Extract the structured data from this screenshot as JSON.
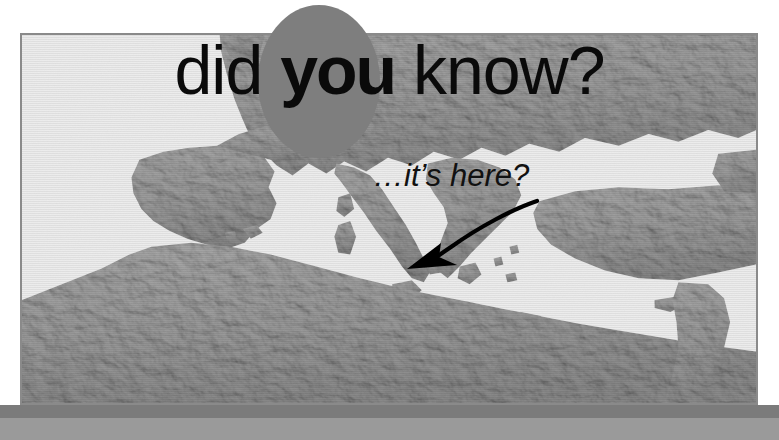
{
  "poster": {
    "headline": {
      "part1": "did ",
      "emphasis": "you",
      "part2": " know?"
    },
    "caption": "…it’s here?",
    "ellipse_color": "#7e7e7e",
    "headline_color": "#0a0a0a",
    "arrow_color": "#000000",
    "frame_border_color": "#8a8a8a",
    "band_dark_color": "#7b7b7b",
    "band_light_color": "#9a9a9a",
    "map": {
      "description": "Grayscale shaded-relief map of the Mediterranean basin and Europe",
      "sea_color": "#ededed",
      "land_color": "#9b9b9b",
      "land_shadow_color": "#818181",
      "regions": [
        "Iberian Peninsula",
        "France",
        "Italy",
        "Balkans",
        "Greece",
        "Turkey",
        "Black Sea",
        "North Africa",
        "Sicily",
        "Sardinia",
        "Corsica",
        "Crete",
        "Cyprus",
        "British Isles"
      ],
      "arrow_target": "Italy"
    }
  }
}
